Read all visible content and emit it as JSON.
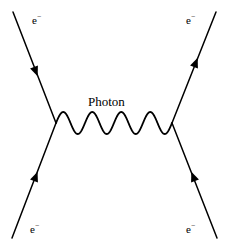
{
  "diagram": {
    "type": "feynman-diagram",
    "name": "Moller scattering",
    "background_color": "#ffffff",
    "stroke_color": "#000000",
    "width": 229,
    "height": 249,
    "propagator": {
      "name": "photon",
      "label": "Photon",
      "style": "wavy",
      "oscillation_count": 4,
      "amplitude": 11,
      "start_x": 56,
      "start_y": 123,
      "end_x": 172,
      "end_y": 123
    },
    "vertices": [
      {
        "name": "left-vertex",
        "x": 56,
        "y": 123
      },
      {
        "name": "right-vertex",
        "x": 172,
        "y": 123
      }
    ],
    "legs": [
      {
        "name": "incoming-electron-top-left",
        "label": "e",
        "charge": "−",
        "x1": 13,
        "y1": 12,
        "x2": 56,
        "y2": 123,
        "arrow_x": 34,
        "arrow_y": 67,
        "arrow_direction": "toward-vertex"
      },
      {
        "name": "outgoing-electron-top-right",
        "label": "e",
        "charge": "−",
        "x1": 172,
        "y1": 123,
        "x2": 216,
        "y2": 12,
        "arrow_x": 194,
        "arrow_y": 67,
        "arrow_direction": "away-from-vertex"
      },
      {
        "name": "incoming-electron-bottom-left",
        "label": "e",
        "charge": "−",
        "x1": 12,
        "y1": 238,
        "x2": 56,
        "y2": 123,
        "arrow_x": 34,
        "arrow_y": 181,
        "arrow_direction": "toward-vertex"
      },
      {
        "name": "outgoing-electron-bottom-right",
        "label": "e",
        "charge": "−",
        "x1": 172,
        "y1": 123,
        "x2": 217,
        "y2": 238,
        "arrow_x": 195,
        "arrow_y": 181,
        "arrow_direction": "away-from-vertex"
      }
    ],
    "labels": {
      "in_top_left": "e",
      "in_top_left_sup": "−",
      "out_top_right": "e",
      "out_top_right_sup": "−",
      "in_bottom_left": "e",
      "in_bottom_left_sup": "−",
      "out_bottom_right": "e",
      "out_bottom_right_sup": "−",
      "photon": "Photon"
    }
  }
}
